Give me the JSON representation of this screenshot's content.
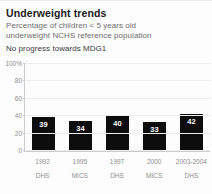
{
  "header": {
    "title": "Underweight trends",
    "subtitle_lines": [
      "Percentage of children < 5 years old",
      "underweight NCHS reference population"
    ],
    "note": "No progress towards MDG1"
  },
  "chart_data": {
    "type": "bar",
    "title": "Underweight trends",
    "subtitle": "Percentage of children < 5 years old underweight NCHS reference population",
    "annotation": "No progress towards MDG1",
    "xlabel": "",
    "ylabel": "",
    "ylim": [
      0,
      100
    ],
    "grid": true,
    "legend": "none",
    "bar_color": "#0d0d0d",
    "categories": [
      "1992",
      "1995",
      "1997",
      "2000",
      "2003-2004"
    ],
    "sources": [
      "DHS",
      "MICS",
      "DHS",
      "MICS",
      "DHS"
    ],
    "values": [
      39,
      34,
      40,
      33,
      42
    ],
    "ytick_labels": [
      "100%",
      "80",
      "60",
      "40",
      "20",
      "0"
    ],
    "ytick_values": [
      100,
      80,
      60,
      40,
      20,
      0
    ],
    "points": [
      {
        "category": "1992",
        "source": "DHS",
        "value": 39
      },
      {
        "category": "1995",
        "source": "MICS",
        "value": 34
      },
      {
        "category": "1997",
        "source": "DHS",
        "value": 40
      },
      {
        "category": "2000",
        "source": "MICS",
        "value": 33
      },
      {
        "category": "2003-2004",
        "source": "DHS",
        "value": 42
      }
    ]
  }
}
